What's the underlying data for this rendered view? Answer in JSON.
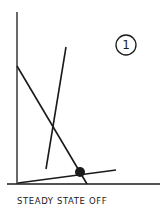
{
  "diagram": {
    "caption": "STEADY STATE OFF",
    "badge_number": "1",
    "stroke_color": "#1a1a1a",
    "axes": {
      "y_axis": {
        "x1": 17,
        "y1": 12,
        "x2": 17,
        "y2": 184
      },
      "x_axis": {
        "x1": 7,
        "y1": 184,
        "x2": 160,
        "y2": 184
      }
    },
    "lines": [
      {
        "name": "descending-line",
        "x1": 17,
        "y1": 66,
        "x2": 87,
        "y2": 184
      },
      {
        "name": "steep-line",
        "x1": 66,
        "y1": 47,
        "x2": 46,
        "y2": 169
      },
      {
        "name": "shallow-line",
        "x1": 18,
        "y1": 183,
        "x2": 116,
        "y2": 170
      }
    ],
    "equilibrium_point": {
      "cx": 80,
      "cy": 172,
      "r": 5
    },
    "badge": {
      "cx": 126,
      "cy": 45,
      "r": 10
    }
  }
}
